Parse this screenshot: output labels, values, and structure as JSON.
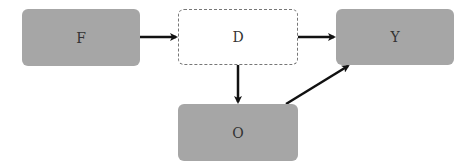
{
  "diagram": {
    "nodes": [
      {
        "id": "F",
        "label": "F",
        "style": "filled"
      },
      {
        "id": "D",
        "label": "D",
        "style": "dashed"
      },
      {
        "id": "Y",
        "label": "Y",
        "style": "filled"
      },
      {
        "id": "O",
        "label": "O",
        "style": "filled"
      }
    ],
    "edges": [
      {
        "from": "F",
        "to": "D"
      },
      {
        "from": "D",
        "to": "Y"
      },
      {
        "from": "D",
        "to": "O"
      },
      {
        "from": "O",
        "to": "Y"
      }
    ],
    "colors": {
      "filled": "#a6a6a6",
      "dashed_border": "#777777",
      "arrow": "#111111"
    }
  }
}
